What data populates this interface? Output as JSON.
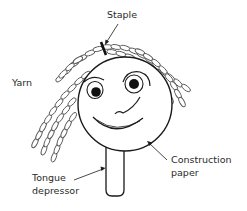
{
  "figure": {
    "labels": {
      "staple": "Staple",
      "yarn": "Yarn",
      "construction_paper_line1": "Construction",
      "construction_paper_line2": "paper",
      "tongue_depressor_line1": "Tongue",
      "tongue_depressor_line2": "depressor"
    },
    "colors": {
      "line": "#1a1a1a",
      "yarn": "#555555",
      "background": "#ffffff",
      "text": "#2a2a2a"
    }
  }
}
